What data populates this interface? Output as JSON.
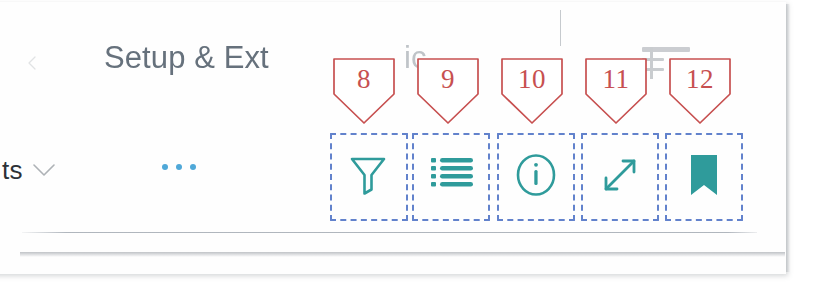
{
  "document": {
    "kind": "photographed-manual-page",
    "page_background": "#ffffff",
    "paper_color": "#fefefe"
  },
  "colors": {
    "icon_teal": "#2f9b9b",
    "callout_red": "#c75050",
    "highlight_blue": "#6282cc",
    "title_gray": "#5a6672",
    "accent_blue": "#4fa8d8",
    "rule_gray": "#969ea8"
  },
  "app": {
    "header": {
      "back_caret_icon": "chevron-left-icon",
      "title": "Setup & Ext",
      "title_full_hint": "Setup & Extensions",
      "title_ghost_a": "ic",
      "title_ghost_b": "`"
    },
    "command_bar": {
      "filter_dropdown": {
        "label": "ts",
        "chevron_icon": "chevron-down-icon"
      },
      "overflow_menu": {
        "label": "···",
        "icon": "ellipsis-horizontal-icon",
        "dot_count": 3
      },
      "tools": [
        {
          "index": 8,
          "icon": "filter-funnel-icon",
          "name": "filter",
          "label": "Filter"
        },
        {
          "index": 9,
          "icon": "list-lines-icon",
          "name": "list-view",
          "label": "List"
        },
        {
          "index": 10,
          "icon": "info-circle-icon",
          "name": "info",
          "label": "Info"
        },
        {
          "index": 11,
          "icon": "expand-diagonal-arrows-icon",
          "name": "expand",
          "label": "Expand"
        },
        {
          "index": 12,
          "icon": "bookmark-filled-icon",
          "name": "bookmark",
          "label": "Bookmark"
        }
      ]
    }
  },
  "annotations": {
    "style": "numbered shield callouts with dash-dot highlight boxes",
    "badges": [
      {
        "number": "8"
      },
      {
        "number": "9"
      },
      {
        "number": "10"
      },
      {
        "number": "11"
      },
      {
        "number": "12"
      }
    ]
  }
}
